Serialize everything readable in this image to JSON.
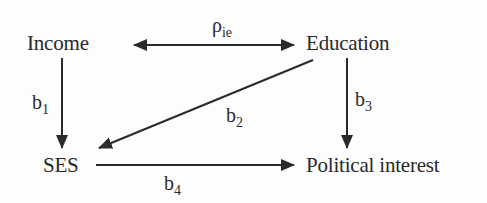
{
  "diagram": {
    "type": "path-diagram",
    "nodes": {
      "income": "Income",
      "education": "Education",
      "ses": "SES",
      "political_interest": "Political interest"
    },
    "edges": [
      {
        "from": "Income",
        "to": "Education",
        "kind": "bidirectional",
        "label_main": "ρ",
        "label_sub": "ie"
      },
      {
        "from": "Income",
        "to": "SES",
        "kind": "directed",
        "label_main": "b",
        "label_sub": "1"
      },
      {
        "from": "Education",
        "to": "SES",
        "kind": "directed",
        "label_main": "b",
        "label_sub": "2"
      },
      {
        "from": "Education",
        "to": "Political interest",
        "kind": "directed",
        "label_main": "b",
        "label_sub": "3"
      },
      {
        "from": "SES",
        "to": "Political interest",
        "kind": "directed",
        "label_main": "b",
        "label_sub": "4"
      }
    ],
    "colors": {
      "ink": "#2a2a2a",
      "background": "#fdfdfd"
    }
  }
}
